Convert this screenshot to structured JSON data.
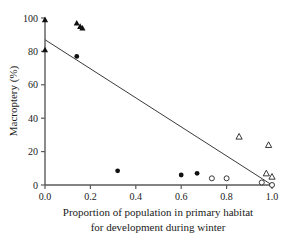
{
  "chart_data": {
    "type": "scatter",
    "title": "",
    "xlabel": "Proportion of population in primary habitat for development during winter",
    "xlabel_line1": "Proportion of population in primary habitat",
    "xlabel_line2": "for development during winter",
    "ylabel": "Macroptery (%)",
    "xlim": [
      0.0,
      1.0
    ],
    "ylim": [
      0,
      100
    ],
    "xticks": [
      0.0,
      0.2,
      0.4,
      0.6,
      0.8,
      1.0
    ],
    "xtick_labels": [
      "0.0",
      "0.2",
      "0.4",
      "0.6",
      "0.8",
      "1.0"
    ],
    "yticks": [
      0,
      20,
      40,
      60,
      80,
      100
    ],
    "ytick_labels": [
      "0",
      "20",
      "40",
      "60",
      "80",
      "100"
    ],
    "grid": false,
    "legend": "none",
    "series": [
      {
        "name": "filled-triangle",
        "marker": "triangle",
        "fill": "#111111",
        "points": [
          {
            "x": 0.0,
            "y": 99
          },
          {
            "x": 0.0,
            "y": 81
          },
          {
            "x": 0.14,
            "y": 97
          },
          {
            "x": 0.155,
            "y": 95
          },
          {
            "x": 0.165,
            "y": 94
          }
        ]
      },
      {
        "name": "filled-circle",
        "marker": "circle",
        "fill": "#111111",
        "points": [
          {
            "x": 0.14,
            "y": 77
          },
          {
            "x": 0.32,
            "y": 8.5
          },
          {
            "x": 0.6,
            "y": 6
          },
          {
            "x": 0.67,
            "y": 7
          }
        ]
      },
      {
        "name": "open-circle",
        "marker": "circle",
        "fill": "#ffffff",
        "points": [
          {
            "x": 0.735,
            "y": 4
          },
          {
            "x": 0.8,
            "y": 4
          },
          {
            "x": 0.955,
            "y": 1.5
          },
          {
            "x": 1.0,
            "y": 0
          }
        ]
      },
      {
        "name": "open-triangle",
        "marker": "triangle",
        "fill": "#ffffff",
        "points": [
          {
            "x": 0.855,
            "y": 29
          },
          {
            "x": 0.985,
            "y": 24
          },
          {
            "x": 0.975,
            "y": 7
          },
          {
            "x": 1.0,
            "y": 5
          }
        ]
      }
    ],
    "fit_line": {
      "name": "regression-line",
      "x0": 0.0,
      "y0": 87,
      "x1": 1.0,
      "y1": 0
    }
  },
  "colors": {
    "background": "#ffffff",
    "axis": "#5a5a5a",
    "text": "#1a1a1a",
    "line": "#3a3a3a",
    "marker_filled": "#111111",
    "marker_open": "#ffffff"
  }
}
